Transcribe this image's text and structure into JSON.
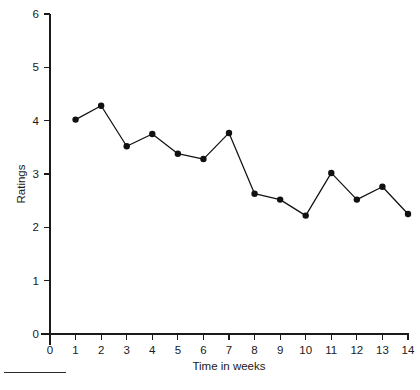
{
  "chart_data": {
    "type": "line",
    "title": "",
    "xlabel": "Time in weeks",
    "ylabel": "Ratings",
    "xlim": [
      0,
      14
    ],
    "ylim": [
      0,
      6
    ],
    "xticks": [
      0,
      1,
      2,
      3,
      4,
      5,
      6,
      7,
      8,
      9,
      10,
      11,
      12,
      13,
      14
    ],
    "yticks": [
      0,
      1,
      2,
      3,
      4,
      5,
      6
    ],
    "grid": false,
    "legend": false,
    "marker": "filled-circle",
    "line_color": "#111111",
    "marker_color": "#111111",
    "x": [
      1,
      2,
      3,
      4,
      5,
      6,
      7,
      8,
      9,
      10,
      11,
      12,
      13,
      14
    ],
    "values": [
      4.02,
      4.28,
      3.52,
      3.75,
      3.38,
      3.28,
      3.77,
      2.63,
      2.52,
      2.22,
      3.02,
      2.52,
      2.76,
      2.25
    ],
    "series": [
      {
        "name": "Ratings",
        "x": [
          1,
          2,
          3,
          4,
          5,
          6,
          7,
          8,
          9,
          10,
          11,
          12,
          13,
          14
        ],
        "values": [
          4.02,
          4.28,
          3.52,
          3.75,
          3.38,
          3.28,
          3.77,
          2.63,
          2.52,
          2.22,
          3.02,
          2.52,
          2.76,
          2.25
        ]
      }
    ]
  },
  "axes": {
    "x_tick_labels": [
      "0",
      "1",
      "2",
      "3",
      "4",
      "5",
      "6",
      "7",
      "8",
      "9",
      "10",
      "11",
      "12",
      "13",
      "14"
    ],
    "y_tick_labels": [
      "0",
      "1",
      "2",
      "3",
      "4",
      "5",
      "6"
    ],
    "x_title": "Time in weeks",
    "y_title": "Ratings"
  }
}
